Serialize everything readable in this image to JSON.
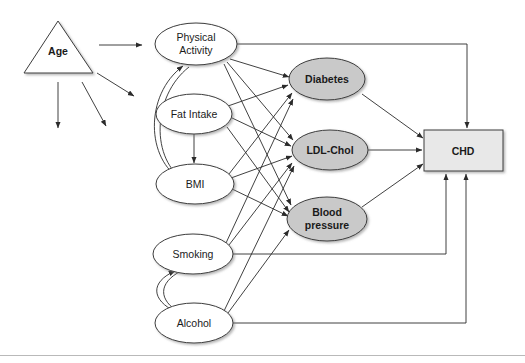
{
  "figure": {
    "background": "#ffffff",
    "border_rule_color": "#b9b9b9"
  },
  "colors": {
    "shaded_node_fill": "#c9c9c9",
    "open_node_fill": "#ffffff",
    "outcome_fill": "#e8e8e8",
    "stroke": "#3c3c3c",
    "edge": "#2b2b2b"
  },
  "nodes": {
    "age": {
      "label": "Age",
      "shape": "triangle",
      "style": "open",
      "bold": true
    },
    "physical": {
      "label_line1": "Physical",
      "label_line2": "Activity",
      "shape": "ellipse",
      "style": "open",
      "bold": false
    },
    "fat": {
      "label": "Fat Intake",
      "shape": "ellipse",
      "style": "open",
      "bold": false
    },
    "bmi": {
      "label": "BMI",
      "shape": "ellipse",
      "style": "open",
      "bold": false
    },
    "smoking": {
      "label": "Smoking",
      "shape": "ellipse",
      "style": "open",
      "bold": false
    },
    "alcohol": {
      "label": "Alcohol",
      "shape": "ellipse",
      "style": "open",
      "bold": false
    },
    "diabetes": {
      "label": "Diabetes",
      "shape": "ellipse",
      "style": "shaded",
      "bold": true
    },
    "ldl": {
      "label": "LDL-Chol",
      "shape": "ellipse",
      "style": "shaded",
      "bold": true
    },
    "bp": {
      "label_line1": "Blood",
      "label_line2": "pressure",
      "shape": "ellipse",
      "style": "shaded",
      "bold": true
    },
    "chd": {
      "label": "CHD",
      "shape": "rectangle",
      "style": "outcome",
      "bold": true
    }
  },
  "edges": [
    {
      "from": "age",
      "to": "physical",
      "kind": "straight-arrow"
    },
    {
      "from": "age",
      "to": "fat",
      "kind": "straight-arrow"
    },
    {
      "from": "age",
      "to": "down-left",
      "kind": "straight-arrow"
    },
    {
      "from": "age",
      "to": "down-right",
      "kind": "straight-arrow"
    },
    {
      "from": "physical",
      "to": "bmi",
      "kind": "curved-double-arrow"
    },
    {
      "from": "fat",
      "to": "bmi",
      "kind": "straight-arrow"
    },
    {
      "from": "smoking",
      "to": "alcohol",
      "kind": "curved-double-arrow"
    },
    {
      "from": "physical",
      "to": "diabetes",
      "kind": "straight-arrow"
    },
    {
      "from": "physical",
      "to": "ldl",
      "kind": "straight-arrow"
    },
    {
      "from": "physical",
      "to": "bp",
      "kind": "straight-arrow"
    },
    {
      "from": "fat",
      "to": "diabetes",
      "kind": "straight-arrow"
    },
    {
      "from": "fat",
      "to": "ldl",
      "kind": "straight-arrow"
    },
    {
      "from": "fat",
      "to": "bp",
      "kind": "straight-arrow"
    },
    {
      "from": "bmi",
      "to": "diabetes",
      "kind": "straight-arrow"
    },
    {
      "from": "bmi",
      "to": "ldl",
      "kind": "straight-arrow"
    },
    {
      "from": "bmi",
      "to": "bp",
      "kind": "straight-arrow"
    },
    {
      "from": "smoking",
      "to": "diabetes",
      "kind": "straight-arrow"
    },
    {
      "from": "smoking",
      "to": "ldl",
      "kind": "straight-arrow"
    },
    {
      "from": "alcohol",
      "to": "ldl",
      "kind": "straight-arrow"
    },
    {
      "from": "alcohol",
      "to": "bp",
      "kind": "straight-arrow"
    },
    {
      "from": "diabetes",
      "to": "chd",
      "kind": "straight-arrow"
    },
    {
      "from": "ldl",
      "to": "chd",
      "kind": "straight-arrow"
    },
    {
      "from": "bp",
      "to": "chd",
      "kind": "straight-arrow"
    },
    {
      "from": "physical",
      "to": "chd",
      "kind": "orthogonal-arrow"
    },
    {
      "from": "smoking",
      "to": "chd",
      "kind": "orthogonal-arrow"
    },
    {
      "from": "alcohol",
      "to": "chd",
      "kind": "orthogonal-arrow"
    }
  ]
}
